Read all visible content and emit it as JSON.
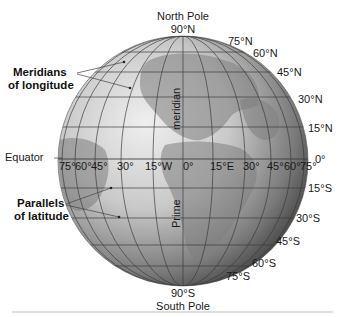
{
  "diagram": {
    "poles": {
      "north": {
        "name": "North Pole",
        "lat": "90°N"
      },
      "south": {
        "name": "South Pole",
        "lat": "90°S"
      }
    },
    "callouts": {
      "meridians": {
        "line1": "Meridians",
        "line2": "of longitude"
      },
      "parallels": {
        "line1": "Parallels",
        "line2": "of latitude"
      },
      "equator": "Equator",
      "prime_meridian": {
        "word1": "Prime",
        "word2": "meridian"
      }
    },
    "latitudes_north": [
      "75°N",
      "60°N",
      "45°N",
      "30°N",
      "15°N"
    ],
    "equator_label_right": "0°",
    "latitudes_south": [
      "15°S",
      "30°S",
      "45°S",
      "60°S",
      "75°S"
    ],
    "longitudes_along_equator": [
      "75°",
      "60°",
      "45°",
      "30°",
      "15°W",
      "0°",
      "15°E",
      "30°",
      "45°",
      "60°",
      "75°"
    ],
    "colors": {
      "globe_light": "#e6e6e6",
      "globe_dark": "#3c3c3c",
      "grid": "#3a3a3a",
      "text": "#1a1a1a",
      "footer_rule": "#bdbdbd"
    }
  }
}
